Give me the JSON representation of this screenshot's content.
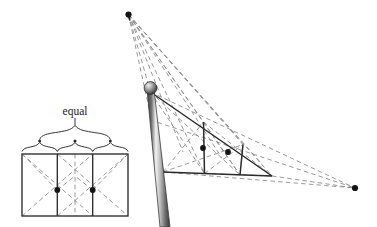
{
  "figure": {
    "type": "geometric-perspective-diagram",
    "background_color": "#ffffff",
    "stroke_color": "#2b2b2b",
    "dashed_color": "#8c8c8c",
    "dot_color": "#141414",
    "mast_light": "#e8e8e8",
    "mast_mid": "#9a9a9a",
    "mast_dark": "#4a4a4a"
  },
  "labels": {
    "equal": "equal"
  },
  "left_panel": {
    "name": "orthographic-view",
    "description": "Front view rectangle divided into three equal vertical panels with diagonals",
    "rect": {
      "x1": 22,
      "y1": 154,
      "x2": 128,
      "y2": 216
    },
    "divider_x": [
      57.3,
      92.7
    ],
    "dots": [
      {
        "x": 57.3,
        "y": 190
      },
      {
        "x": 92.7,
        "y": 190
      }
    ],
    "brace_tick_x": [
      22,
      39.7,
      57.3,
      75,
      92.7,
      110.3,
      128
    ],
    "brace_label_x": 75,
    "brace_label_y": 111
  },
  "right_panel": {
    "name": "perspective-view",
    "description": "Perspective view of the same three equal panels seen from a mast",
    "vanishing_point_top": {
      "x": 128.5,
      "y": 14.5
    },
    "vanishing_point_right": {
      "x": 355,
      "y": 188
    },
    "finial": {
      "x": 150.5,
      "y": 88.5,
      "r": 6
    },
    "mast_top": {
      "x": 150.5,
      "y": 92
    },
    "mast_bottom": {
      "x": 166,
      "y": 227
    },
    "mast_width": 7.5,
    "top_edge_end": {
      "x": 272,
      "y": 176
    },
    "bottom_edge_start": {
      "x": 163,
      "y": 172
    },
    "bottom_edge_end": {
      "x": 272,
      "y": 176
    },
    "rails": [
      {
        "top_x": 150.5,
        "top_y": 92,
        "bot_x": 163,
        "bot_y": 172
      },
      {
        "top_x": 203.5,
        "top_y": 122,
        "bot_x": 204.5,
        "bot_y": 173.5
      },
      {
        "top_x": 243,
        "top_y": 144.5,
        "bot_x": 240,
        "bot_y": 175
      },
      {
        "top_x": 272,
        "top_y": 176,
        "bot_x": 272,
        "bot_y": 176
      }
    ],
    "dots": [
      {
        "x": 203,
        "y": 148
      },
      {
        "x": 228,
        "y": 152
      }
    ]
  },
  "icons": {
    "vanishing_point": "vanishing-point-dot",
    "finial": "mast-finial-ball",
    "brace": "equal-division-brace"
  }
}
